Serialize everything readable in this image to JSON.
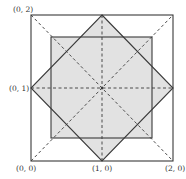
{
  "diagram": {
    "labels": {
      "top_left": "(0, 2)",
      "mid_left": "(0, 1)",
      "bottom_left": "(0, 0)",
      "bottom_mid": "(1, 0)",
      "bottom_right": "(2, 0)"
    },
    "colors": {
      "stroke": "#3a3a3a",
      "fill": "#e2e2e2",
      "background": "#ffffff"
    },
    "shapes": {
      "outer_square": "square with corners (0,0),(2,0),(2,2),(0,2)",
      "diamond": "square with vertices (1,0),(2,1),(1,2),(0,1)",
      "inner_square": "axis-aligned shaded square centered at (1,1)",
      "dashed_lines": [
        "diagonal (0,0)-(2,2)",
        "diagonal (2,0)-(0,2)",
        "horizontal y=1",
        "vertical x=1"
      ]
    }
  }
}
